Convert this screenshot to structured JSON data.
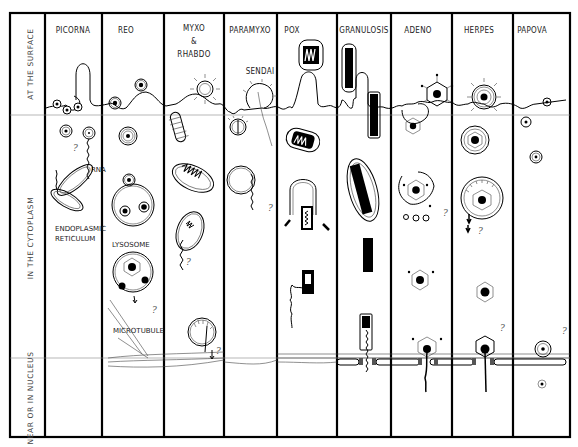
{
  "diagram": {
    "type": "virus-entry-and-replication-site-comparison",
    "row_labels": [
      {
        "id": "surface",
        "text": "AT THE SURFACE"
      },
      {
        "id": "cytoplasm",
        "text": "IN THE CYTOPLASM"
      },
      {
        "id": "nucleus",
        "text": "NEAR OR IN NUCLEUS"
      }
    ],
    "columns": [
      {
        "id": "picorna",
        "title": "PICORNA",
        "subtitle": ""
      },
      {
        "id": "reo",
        "title": "REO",
        "subtitle": ""
      },
      {
        "id": "myxo-rhabdo",
        "title": "MYXO",
        "amp": "&",
        "title2": "RHABDO"
      },
      {
        "id": "paramyxo",
        "title": "PARAMYXO",
        "subtitle": "SENDAI"
      },
      {
        "id": "pox",
        "title": "POX",
        "subtitle": ""
      },
      {
        "id": "granulosis",
        "title": "GRANULOSIS",
        "subtitle": ""
      },
      {
        "id": "adeno",
        "title": "ADENO",
        "subtitle": ""
      },
      {
        "id": "herpes",
        "title": "HERPES",
        "subtitle": ""
      },
      {
        "id": "papova",
        "title": "PAPOVA",
        "subtitle": ""
      }
    ],
    "annotations": {
      "rna": "RNA",
      "er_line1": "ENDOPLASMIC",
      "er_line2": "RETICULUM",
      "lysosome": "LYSOSOME",
      "microtubule": "MICROTUBULE",
      "question": "?"
    }
  }
}
